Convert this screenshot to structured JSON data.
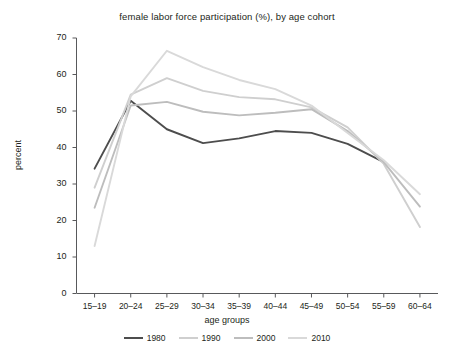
{
  "chart_data": {
    "type": "line",
    "title": "female labor force participation (%), by age cohort",
    "xlabel": "age groups",
    "ylabel": "percent",
    "categories": [
      "15–19",
      "20–24",
      "25–29",
      "30–34",
      "35–39",
      "40–44",
      "45–49",
      "50–54",
      "55–59",
      "60–64"
    ],
    "ylim": [
      0,
      70
    ],
    "yticks": [
      0,
      10,
      20,
      30,
      40,
      50,
      60,
      70
    ],
    "ytick_labels": [
      "0",
      "10",
      "20",
      "30",
      "40",
      "50",
      "60",
      "70"
    ],
    "grid": false,
    "legend_position": "bottom",
    "series": [
      {
        "name": "1980",
        "color": "#4d4d4d",
        "values": [
          34.2,
          52.8,
          45.0,
          41.2,
          42.5,
          44.5,
          44.0,
          41.0,
          36.0,
          null
        ]
      },
      {
        "name": "1990",
        "color": "#cfcfcf",
        "values": [
          29.0,
          54.5,
          59.0,
          55.5,
          53.8,
          53.2,
          51.0,
          45.5,
          35.5,
          18.2
        ]
      },
      {
        "name": "2000",
        "color": "#bdbdbd",
        "values": [
          23.5,
          51.5,
          52.5,
          49.8,
          48.8,
          49.5,
          50.5,
          44.5,
          36.0,
          23.8
        ]
      },
      {
        "name": "2010",
        "color": "#d9d9d9",
        "values": [
          13.0,
          54.0,
          66.5,
          62.0,
          58.5,
          56.0,
          51.5,
          44.0,
          36.5,
          27.2
        ]
      }
    ]
  },
  "legend": {
    "items": [
      {
        "label": "1980"
      },
      {
        "label": "1990"
      },
      {
        "label": "2000"
      },
      {
        "label": "2010"
      }
    ]
  },
  "axis": {
    "ylabel": "percent",
    "xlabel": "age groups"
  }
}
